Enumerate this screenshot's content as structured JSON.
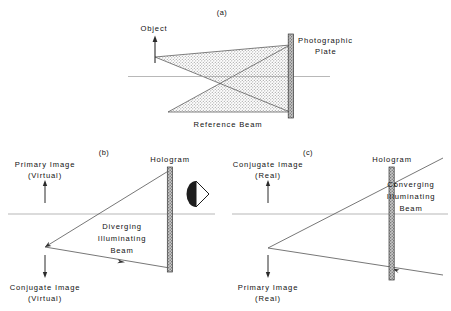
{
  "figure": {
    "title_tags": {
      "a": "(a)",
      "b": "(b)",
      "c": "(c)"
    },
    "colors": {
      "ink": "#111111",
      "ray": "#555555",
      "axis": "#888888",
      "plate_fill": "#b9b9b9",
      "plate_edge": "#3a3a3a",
      "beam_shade": "#d2d2d2",
      "background": "#ffffff"
    }
  },
  "panel_a": {
    "tag": "(a)",
    "labels": {
      "object": "Object",
      "photographic_plate_line1": "Photographic",
      "photographic_plate_line2": "Plate",
      "reference_beam": "Reference Beam"
    },
    "elements": {
      "object_arrow": "up-arrow-icon",
      "plate": "photographic-plate-bar",
      "optical_axis": "horizontal-axis-line",
      "object_beam": "shaded-beam-triangle",
      "reference_beam_cone": "shaded-beam-triangle"
    }
  },
  "panel_b": {
    "tag": "(b)",
    "labels": {
      "primary_image_line1": "Primary Image",
      "primary_image_line2": "(Virtual)",
      "hologram": "Hologram",
      "beam_line1": "Diverging",
      "beam_line2": "Illuminating",
      "beam_line3": "Beam",
      "conjugate_image_line1": "Conjugate Image",
      "conjugate_image_line2": "(Virtual)"
    },
    "elements": {
      "primary_image_arrow": "up-arrow-icon",
      "conjugate_image_arrow": "down-arrow-icon",
      "hologram": "hologram-plate-bar",
      "observer": "eye-icon",
      "optical_axis": "horizontal-axis-line",
      "upper_ray": "ray-arrow-left",
      "lower_ray": "ray-arrow-right"
    }
  },
  "panel_c": {
    "tag": "(c)",
    "labels": {
      "conjugate_image_line1": "Conjugate Image",
      "conjugate_image_line2": "(Real)",
      "hologram": "Hologram",
      "beam_line1": "Converging",
      "beam_line2": "Illuminating",
      "beam_line3": "Beam",
      "primary_image_line1": "Primary Image",
      "primary_image_line2": "(Real)"
    },
    "elements": {
      "conjugate_image_arrow": "up-arrow-icon",
      "primary_image_arrow": "down-arrow-icon",
      "hologram": "hologram-plate-bar",
      "optical_axis": "horizontal-axis-line",
      "upper_ray": "ray-arrow-left",
      "lower_ray": "ray-arrow-left"
    }
  }
}
